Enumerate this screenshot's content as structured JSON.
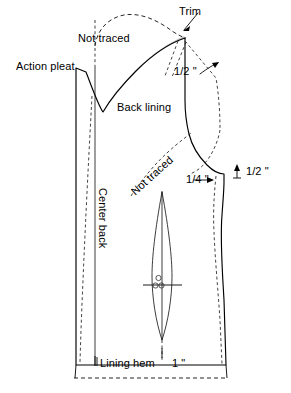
{
  "diagram": {
    "piece_label": "Back lining",
    "labels": {
      "trim": "Trim",
      "not_traced_top": "Not traced",
      "not_traced_mid": "Not traced",
      "action_pleat": "Action pleat",
      "center_back": "Center back",
      "back_lining": "Back lining",
      "lining_hem": "Lining hem",
      "shoulder_ext": "1/2 \"",
      "armhole_ext": "1/2 \"",
      "side_ext": "1/4 \"",
      "hem_allowance": "1 \""
    },
    "colors": {
      "ink": "#000000",
      "shade": "#c9c9c9",
      "paper": "#ffffff"
    },
    "markings": {
      "dart_circles": 3,
      "grainline_present": false
    }
  }
}
